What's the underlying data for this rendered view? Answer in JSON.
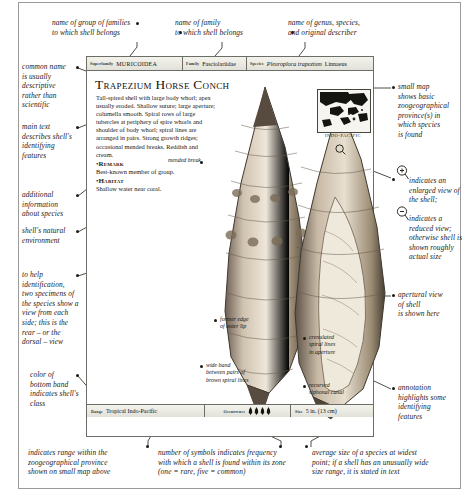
{
  "annotations": {
    "top": [
      {
        "id": "superfamily-note",
        "text": "name of group of families\nto which shell belongs"
      },
      {
        "id": "family-note",
        "text": "name of family\nto which shell belongs"
      },
      {
        "id": "species-note",
        "text": "name of genus, species,\nand original describer"
      }
    ],
    "left": [
      {
        "id": "common-name-note",
        "text": "common name\nis usually\ndescriptive\nrather than scientific"
      },
      {
        "id": "main-text-note",
        "text": "main text\ndescribes shell's\nidentifying\nfeatures"
      },
      {
        "id": "additional-info-note",
        "text": "additional\ninformation\nabout species"
      },
      {
        "id": "habitat-note",
        "text": "shell's natural\nenvironment"
      },
      {
        "id": "two-specimens-note",
        "text": "to help\nidentification,\ntwo specimens of\nthe species show a\nview from each\nside; this is the\nrear – or the\ndorsal – view"
      },
      {
        "id": "band-color-note",
        "text": "color of\nbottom band\nindicates shell's\nclass"
      }
    ],
    "right": [
      {
        "id": "map-note",
        "text": "small map\nshows basic\nzoogeographical\nprovince(s) in\nwhich species\nis found"
      },
      {
        "id": "enlarged-view-note",
        "text": "indicates an\nenlarged view of\nthe shell;"
      },
      {
        "id": "reduced-view-note",
        "text": "indicates a\nreduced view;\notherwise shell is\nshown roughly\nactual size"
      },
      {
        "id": "apertural-view-note",
        "text": "apertural view\nof shell\nis shown here"
      },
      {
        "id": "annotation-note",
        "text": "annotation\nhighlights some\nidentifying\nfeatures"
      }
    ],
    "bottom": [
      {
        "id": "range-note",
        "text": "indicates range within the\nzoogeographical province\nshown on small map above"
      },
      {
        "id": "occurrence-note",
        "text": "number of symbols indicates frequency\nwith which a shell is found within its zone\n(one = rare, five = common)"
      },
      {
        "id": "size-note",
        "text": "average size of a species at widest\npoint; if a shell has an unusually wide\nsize range, it is stated in text"
      }
    ],
    "figure": [
      {
        "id": "mended-break-note",
        "text": "mended break"
      },
      {
        "id": "outer-lip-note",
        "text": "former edge\nof outer lip"
      },
      {
        "id": "wide-band-note",
        "text": "wide band\nbetween pairs of\nbrown spiral lines"
      },
      {
        "id": "crenulated-note",
        "text": "crenulated\nspiral lines\nin aperture"
      },
      {
        "id": "siphonal-canal-note",
        "text": "recurved\nsiphonal canal"
      }
    ]
  },
  "card": {
    "taxonomy": {
      "superfamily_key": "Superfamily",
      "superfamily_value": "MURICOIDEA",
      "family_key": "Family",
      "family_value": "Fasciolariidae",
      "species_key": "Species",
      "species_genus": "Pleuroploca trapezium",
      "species_author": "Linnaeus"
    },
    "title": "Trapezium Horse Conch",
    "description": "Tall-spired shell with large body whorl; apex usually eroded. Shallow suture; large aperture; columella smooth. Spiral rows of large tubercles at periphery of spire whorls and shoulder of body whorl; spiral lines are arranged in pairs. Strong growth ridges; occasional mended breaks. Reddish and cream.",
    "remark_label": "Remark",
    "remark_text": "Best-known member of group.",
    "habitat_label": "Habitat",
    "habitat_text": "Shallow water near coral.",
    "map_label": "INDO-PACIFIC",
    "footer": {
      "range_key": "Range",
      "range_value": "Tropical Indo-Pacific",
      "occurrence_key": "Occurrence",
      "occurrence_count": 4,
      "size_key": "Size",
      "size_value": "5 in. (13 cm)"
    }
  },
  "icons": {
    "magnifier_plus": "enlarged-view-icon",
    "magnifier_minus": "reduced-view-icon",
    "occurrence_symbol": "shell-frequency-icon"
  },
  "colors": {
    "frame": "#6d6d68",
    "text": "#1a1a1a",
    "leader": "#3a3a33",
    "bar_fill": "#e9e8e2"
  }
}
